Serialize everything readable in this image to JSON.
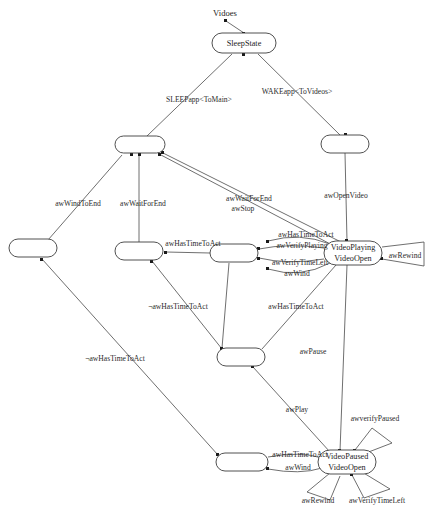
{
  "diagram": {
    "type": "state-transition-diagram",
    "caption": "Vidoes",
    "nodes": [
      {
        "id": "sleep",
        "label_line1": "SleepState",
        "label_line2": "",
        "x": 244,
        "y": 43,
        "w": 64,
        "h": 20
      },
      {
        "id": "n_topleft",
        "label_line1": "",
        "label_line2": "",
        "x": 140,
        "y": 145,
        "w": 50,
        "h": 17
      },
      {
        "id": "n_topright",
        "label_line1": "",
        "label_line2": "",
        "x": 345,
        "y": 144,
        "w": 48,
        "h": 18
      },
      {
        "id": "n_far_left",
        "label_line1": "",
        "label_line2": "",
        "x": 33,
        "y": 248,
        "w": 48,
        "h": 18
      },
      {
        "id": "n_mid_left",
        "label_line1": "",
        "label_line2": "",
        "x": 139,
        "y": 251,
        "w": 48,
        "h": 18
      },
      {
        "id": "n_mid_center",
        "label_line1": "",
        "label_line2": "",
        "x": 234,
        "y": 253,
        "w": 48,
        "h": 18
      },
      {
        "id": "playing",
        "label_line1": "VideoPlaying",
        "label_line2": "VideoOpen",
        "x": 353,
        "y": 253,
        "w": 58,
        "h": 24
      },
      {
        "id": "n_bot_mid",
        "label_line1": "",
        "label_line2": "",
        "x": 241,
        "y": 357,
        "w": 48,
        "h": 18
      },
      {
        "id": "n_bot_left",
        "label_line1": "",
        "label_line2": "",
        "x": 242,
        "y": 462,
        "w": 52,
        "h": 18
      },
      {
        "id": "paused",
        "label_line1": "VideoPaused",
        "label_line2": "VideoOpen",
        "x": 347,
        "y": 462,
        "w": 58,
        "h": 24
      }
    ],
    "edges": [
      {
        "id": "e1",
        "label": "SLEEPapp<ToMain>",
        "lx": 199,
        "ly": 100
      },
      {
        "id": "e2",
        "label": "WAKEapp<ToVideos>",
        "lx": 297,
        "ly": 92
      },
      {
        "id": "e3",
        "label": "awWindToEnd",
        "lx": 78,
        "ly": 204
      },
      {
        "id": "e4",
        "label": "awWaitForEnd",
        "lx": 143,
        "ly": 204
      },
      {
        "id": "e5",
        "label": "awWaitForEnd",
        "lx": 249,
        "ly": 199
      },
      {
        "id": "e6",
        "label": "awStop",
        "lx": 243,
        "ly": 209
      },
      {
        "id": "e7",
        "label": "awOpenVideo",
        "lx": 346,
        "ly": 196
      },
      {
        "id": "e8",
        "label": "awHasTimeToAct",
        "lx": 193,
        "ly": 244
      },
      {
        "id": "e9",
        "label": "awHasTimeToAct",
        "lx": 306,
        "ly": 235
      },
      {
        "id": "e10",
        "label": "awVerifyPlaying",
        "lx": 302,
        "ly": 246
      },
      {
        "id": "e11",
        "label": "awVerifyTimeLeft",
        "lx": 300,
        "ly": 263
      },
      {
        "id": "e12",
        "label": "awWind",
        "lx": 297,
        "ly": 274
      },
      {
        "id": "e13",
        "label": "awRewind",
        "lx": 405,
        "ly": 256
      },
      {
        "id": "e14",
        "label": "¬awHasTimeToAct",
        "lx": 178,
        "ly": 307
      },
      {
        "id": "e15",
        "label": "awHasTimeToAct",
        "lx": 296,
        "ly": 307
      },
      {
        "id": "e16",
        "label": "¬awHasTimeToAct",
        "lx": 115,
        "ly": 359
      },
      {
        "id": "e17",
        "label": "awPause",
        "lx": 313,
        "ly": 352
      },
      {
        "id": "e18",
        "label": "awPlay",
        "lx": 297,
        "ly": 410
      },
      {
        "id": "e19",
        "label": "awverifyPaused",
        "lx": 375,
        "ly": 419
      },
      {
        "id": "e20",
        "label": "awHasTimeToAct",
        "lx": 300,
        "ly": 455
      },
      {
        "id": "e21",
        "label": "awWind",
        "lx": 298,
        "ly": 468
      },
      {
        "id": "e22",
        "label": "awRewind",
        "lx": 318,
        "ly": 501
      },
      {
        "id": "e23",
        "label": "awVerifyTimeLeft",
        "lx": 377,
        "ly": 501
      }
    ]
  }
}
